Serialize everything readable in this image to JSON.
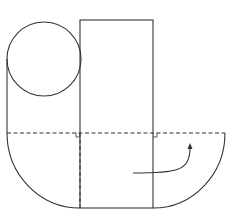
{
  "diagram": {
    "stroke_color": "#333333",
    "background": "#ffffff",
    "shapes": {
      "circle": {
        "cx": 44,
        "cy": 59,
        "r": 37
      },
      "rectangle": {
        "x": 80,
        "y": 20,
        "width": 73,
        "height": 188
      },
      "left_side_line": {
        "x": 7,
        "y1": 59,
        "y2": 133
      },
      "dashed_horizontal": {
        "x1": 7,
        "x2": 225,
        "y": 133
      },
      "dashed_vertical": {
        "x": 80,
        "y1": 133,
        "y2": 208
      },
      "left_arc": {
        "from": [
          7,
          133
        ],
        "to": [
          80,
          208
        ],
        "r": 73
      },
      "right_arc": {
        "from": [
          225,
          133
        ],
        "to": [
          153,
          208
        ],
        "r": 72
      },
      "right_angle_marks": [
        [
          80,
          133
        ],
        [
          153,
          133
        ]
      ],
      "arrow": {
        "start": [
          133,
          173
        ],
        "control": [
          190,
          175
        ],
        "end": [
          190,
          146
        ]
      }
    }
  }
}
